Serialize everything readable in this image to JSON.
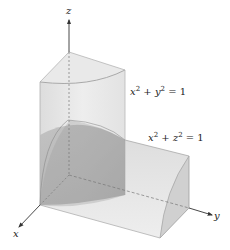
{
  "figure": {
    "axes": {
      "x_label": "x",
      "y_label": "y",
      "z_label": "z"
    },
    "equations": [
      {
        "id": "cyl1",
        "lhs_a": "x",
        "lhs_b": "y",
        "exp": "2",
        "rhs": "= 1",
        "plus": "+"
      },
      {
        "id": "cyl2",
        "lhs_a": "x",
        "lhs_b": "z",
        "exp": "2",
        "rhs": "= 1",
        "plus": "+"
      }
    ],
    "colors": {
      "surface_light": "#e6e6e6",
      "surface_mid": "#d4d4d4",
      "surface_dark": "#a9a9a9",
      "edge": "#9a9a9a",
      "axis": "#333333"
    }
  }
}
